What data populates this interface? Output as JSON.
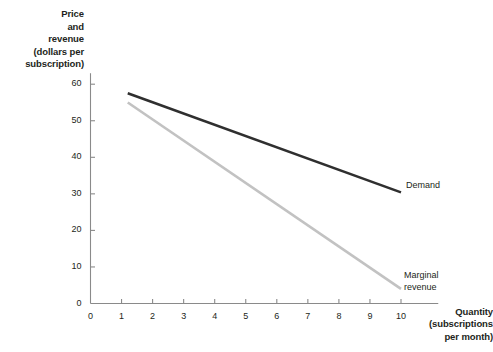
{
  "chart_data": {
    "type": "line",
    "title": "",
    "subtitle": "",
    "xlabel": "Quantity\n(subscriptions\nper month)",
    "ylabel": "Price\nand\nrevenue\n(dollars per\nsubscription)",
    "xlim": [
      0,
      11.2
    ],
    "ylim": [
      0,
      63
    ],
    "grid": false,
    "legend_position": "inline-right-of-line-end",
    "xticks": [
      0,
      1,
      2,
      3,
      4,
      5,
      6,
      7,
      8,
      9,
      10
    ],
    "xtick_labels": [
      "0",
      "1",
      "2",
      "3",
      "4",
      "5",
      "6",
      "7",
      "8",
      "9",
      "10"
    ],
    "yticks": [
      0,
      10,
      20,
      30,
      40,
      50,
      60
    ],
    "ytick_labels": [
      "0",
      "10",
      "20",
      "30",
      "40",
      "50",
      "60"
    ],
    "series": [
      {
        "name": "Demand",
        "label": "Demand",
        "color": "#2f2f2f",
        "width": 2.6,
        "x": [
          1.2,
          10
        ],
        "values": [
          57.5,
          30.4
        ]
      },
      {
        "name": "Marginal revenue",
        "label": "Marginal\nrevenue",
        "color": "#c2c2c2",
        "width": 2.6,
        "x": [
          1.2,
          10
        ],
        "values": [
          55.0,
          4.0
        ]
      }
    ],
    "annotations": [
      {
        "name": "demand-label",
        "text": "Demand",
        "x": 10.35,
        "y": 30.4
      },
      {
        "name": "marginal-revenue-label",
        "text": "Marginal\nrevenue",
        "x": 10.3,
        "y": 9.5
      }
    ]
  },
  "axes": {
    "axis_color": "#8a8a8a",
    "tick_color": "#8a8a8a",
    "text_color": "#231f20"
  },
  "background": "#ffffff"
}
